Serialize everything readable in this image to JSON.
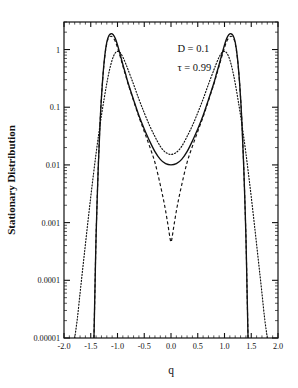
{
  "chart_data": {
    "type": "line",
    "title": "",
    "xlabel": "q",
    "ylabel": "Stationary Distribution",
    "xlim": [
      -2.0,
      2.0
    ],
    "ylim": [
      1e-05,
      3.0
    ],
    "yscale": "log",
    "grid": false,
    "legend": null,
    "xticks": [
      "-2.0",
      "-1.5",
      "-1.0",
      "-0.5",
      "0.0",
      "0.5",
      "1.0",
      "1.5",
      "2.0"
    ],
    "xtick_values": [
      -2.0,
      -1.5,
      -1.0,
      -0.5,
      0.0,
      0.5,
      1.0,
      1.5,
      2.0
    ],
    "yticks": [
      "1",
      "0.1",
      "0.01",
      "0.001",
      "0.0001",
      "0.00001"
    ],
    "ytick_values": [
      1,
      0.1,
      0.01,
      0.001,
      0.0001,
      1e-05
    ],
    "annotations": [
      {
        "text": "D = 0.1",
        "x": 0.12,
        "y": 0.9
      },
      {
        "text": "τ = 0.99",
        "x": 0.12,
        "y": 0.42
      }
    ],
    "series": [
      {
        "name": "solid",
        "style": "solid",
        "x": [
          -1.44,
          -1.42,
          -1.4,
          -1.36,
          -1.32,
          -1.28,
          -1.24,
          -1.2,
          -1.16,
          -1.12,
          -1.08,
          -1.04,
          -1.0,
          -0.95,
          -0.9,
          -0.85,
          -0.8,
          -0.7,
          -0.6,
          -0.5,
          -0.4,
          -0.3,
          -0.2,
          -0.1,
          0.0,
          0.1,
          0.2,
          0.3,
          0.4,
          0.5,
          0.6,
          0.7,
          0.8,
          0.85,
          0.9,
          0.95,
          1.0,
          1.04,
          1.08,
          1.12,
          1.16,
          1.2,
          1.24,
          1.28,
          1.32,
          1.36,
          1.4,
          1.42,
          1.44
        ],
        "y": [
          1e-05,
          8e-05,
          0.0006,
          0.009,
          0.07,
          0.28,
          0.75,
          1.35,
          1.75,
          1.88,
          1.8,
          1.55,
          1.2,
          0.82,
          0.55,
          0.38,
          0.26,
          0.135,
          0.072,
          0.042,
          0.026,
          0.017,
          0.0125,
          0.0105,
          0.01,
          0.0105,
          0.0125,
          0.017,
          0.026,
          0.042,
          0.072,
          0.135,
          0.26,
          0.38,
          0.55,
          0.82,
          1.2,
          1.55,
          1.8,
          1.88,
          1.75,
          1.35,
          0.75,
          0.28,
          0.07,
          0.009,
          0.0006,
          8e-05,
          1e-05
        ]
      },
      {
        "name": "dashed",
        "style": "dashed",
        "x": [
          -1.44,
          -1.42,
          -1.4,
          -1.36,
          -1.32,
          -1.28,
          -1.24,
          -1.2,
          -1.16,
          -1.12,
          -1.08,
          -1.04,
          -1.0,
          -0.95,
          -0.9,
          -0.85,
          -0.8,
          -0.7,
          -0.6,
          -0.5,
          -0.4,
          -0.3,
          -0.2,
          -0.12,
          -0.06,
          -0.02,
          0.0,
          0.02,
          0.06,
          0.12,
          0.2,
          0.3,
          0.4,
          0.5,
          0.6,
          0.7,
          0.8,
          0.85,
          0.9,
          0.95,
          1.0,
          1.04,
          1.08,
          1.12,
          1.16,
          1.2,
          1.24,
          1.28,
          1.32,
          1.36,
          1.4,
          1.42,
          1.44
        ],
        "y": [
          1e-05,
          8e-05,
          0.0006,
          0.009,
          0.07,
          0.28,
          0.72,
          1.28,
          1.62,
          1.7,
          1.6,
          1.38,
          1.08,
          0.76,
          0.52,
          0.36,
          0.25,
          0.13,
          0.068,
          0.038,
          0.021,
          0.011,
          0.0045,
          0.002,
          0.00095,
          0.00055,
          0.00046,
          0.00055,
          0.00095,
          0.002,
          0.0045,
          0.011,
          0.021,
          0.038,
          0.068,
          0.13,
          0.25,
          0.36,
          0.52,
          0.76,
          1.08,
          1.38,
          1.6,
          1.7,
          1.62,
          1.28,
          0.72,
          0.28,
          0.07,
          0.009,
          0.0006,
          8e-05,
          1e-05
        ]
      },
      {
        "name": "dotted",
        "style": "dotted",
        "x": [
          -1.8,
          -1.75,
          -1.7,
          -1.65,
          -1.6,
          -1.55,
          -1.5,
          -1.45,
          -1.4,
          -1.35,
          -1.3,
          -1.25,
          -1.2,
          -1.15,
          -1.1,
          -1.05,
          -1.0,
          -0.95,
          -0.9,
          -0.85,
          -0.8,
          -0.7,
          -0.6,
          -0.5,
          -0.4,
          -0.3,
          -0.2,
          -0.1,
          0.0,
          0.1,
          0.2,
          0.3,
          0.4,
          0.5,
          0.6,
          0.7,
          0.8,
          0.85,
          0.9,
          0.95,
          1.0,
          1.05,
          1.1,
          1.15,
          1.2,
          1.25,
          1.3,
          1.35,
          1.4,
          1.45,
          1.5,
          1.55,
          1.6,
          1.65,
          1.7,
          1.75,
          1.8
        ],
        "y": [
          1e-05,
          2.2e-05,
          6e-05,
          0.00016,
          0.00042,
          0.0011,
          0.0028,
          0.0068,
          0.016,
          0.035,
          0.072,
          0.14,
          0.26,
          0.44,
          0.66,
          0.85,
          0.93,
          0.88,
          0.74,
          0.58,
          0.44,
          0.25,
          0.138,
          0.08,
          0.048,
          0.031,
          0.021,
          0.0165,
          0.0152,
          0.0165,
          0.021,
          0.031,
          0.048,
          0.08,
          0.138,
          0.25,
          0.44,
          0.58,
          0.74,
          0.88,
          0.93,
          0.85,
          0.66,
          0.44,
          0.26,
          0.14,
          0.072,
          0.035,
          0.016,
          0.0068,
          0.0028,
          0.0011,
          0.00042,
          0.00016,
          6e-05,
          2.2e-05,
          1e-05
        ]
      }
    ]
  }
}
